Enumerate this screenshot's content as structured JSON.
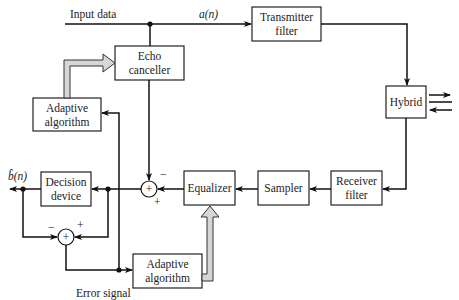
{
  "diagram": {
    "labels": {
      "input_data": "Input data",
      "a_n": "a(n)",
      "b_hat_n": "b̂(n)",
      "error_signal": "Error signal"
    },
    "blocks": {
      "transmitter_filter": [
        "Transmitter",
        "filter"
      ],
      "echo_canceller": [
        "Echo",
        "canceller"
      ],
      "hybrid": [
        "Hybrid"
      ],
      "adaptive_algorithm_top": [
        "Adaptive",
        "algorithm"
      ],
      "receiver_filter": [
        "Receiver",
        "filter"
      ],
      "sampler": [
        "Sampler"
      ],
      "equalizer": [
        "Equalizer"
      ],
      "decision_device": [
        "Decision",
        "device"
      ],
      "adaptive_algorithm_bottom": [
        "Adaptive",
        "algorithm"
      ]
    },
    "summers": {
      "main": {
        "symbol": "+",
        "top_sign": "−",
        "bottom_sign": "+"
      },
      "error": {
        "symbol": "+",
        "left_sign": "−",
        "right_sign": "+"
      }
    },
    "colors": {
      "line": "#111111",
      "box_border": "#222222",
      "fat_arrow_fill": "#d6d6d6"
    }
  }
}
